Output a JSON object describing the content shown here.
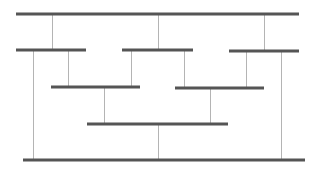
{
  "diagram": {
    "width": 319,
    "height": 169,
    "colors": {
      "background": "#ffffff",
      "bar": "#555555",
      "connector": "#b4b4b4"
    },
    "bar_thickness": 3,
    "connector_thickness": 1,
    "bars": [
      {
        "id": "top",
        "x1": 16,
        "x2": 299,
        "y": 14
      },
      {
        "id": "row2-left",
        "x1": 16,
        "x2": 86,
        "y": 50
      },
      {
        "id": "row2-middle",
        "x1": 122,
        "x2": 193,
        "y": 50
      },
      {
        "id": "row2-right",
        "x1": 229,
        "x2": 299,
        "y": 51
      },
      {
        "id": "row3-left",
        "x1": 51,
        "x2": 140,
        "y": 87
      },
      {
        "id": "row3-right",
        "x1": 175,
        "x2": 264,
        "y": 88
      },
      {
        "id": "row4",
        "x1": 87,
        "x2": 228,
        "y": 124
      },
      {
        "id": "bottom",
        "x1": 23,
        "x2": 305,
        "y": 160
      }
    ],
    "connectors": [
      {
        "x": 52,
        "y1": 14,
        "y2": 50
      },
      {
        "x": 158,
        "y1": 14,
        "y2": 50
      },
      {
        "x": 264,
        "y1": 14,
        "y2": 51
      },
      {
        "x": 33,
        "y1": 50,
        "y2": 160
      },
      {
        "x": 68,
        "y1": 50,
        "y2": 87
      },
      {
        "x": 131,
        "y1": 50,
        "y2": 87
      },
      {
        "x": 184,
        "y1": 50,
        "y2": 88
      },
      {
        "x": 246,
        "y1": 51,
        "y2": 88
      },
      {
        "x": 281,
        "y1": 51,
        "y2": 160
      },
      {
        "x": 104,
        "y1": 87,
        "y2": 124
      },
      {
        "x": 210,
        "y1": 88,
        "y2": 124
      },
      {
        "x": 158,
        "y1": 124,
        "y2": 160
      }
    ]
  }
}
